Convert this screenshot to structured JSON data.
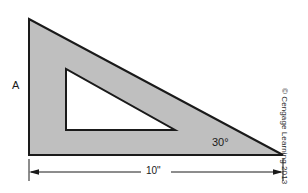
{
  "figure": {
    "labels": {
      "vertical_side": "A",
      "angle": "30°",
      "dimension": "10\""
    },
    "credit": "© Cengage Learning 2013",
    "colors": {
      "background": "#ffffff",
      "fill": "#bfbfbf",
      "outline": "#1a1a1a",
      "dimension_line": "#1a1a1a",
      "inner_fill": "#ffffff"
    },
    "geometry": {
      "outer_triangle": {
        "apex_top": [
          29,
          19
        ],
        "corner_bottom_left": [
          29,
          155
        ],
        "corner_bottom_right": [
          283,
          155
        ]
      },
      "inner_triangle": {
        "corner_top_left": [
          66,
          69
        ],
        "corner_bottom_left": [
          66,
          130
        ],
        "corner_bottom_right": [
          175,
          130
        ]
      },
      "dimension": {
        "y": 172,
        "x_start": 29,
        "x_end": 283,
        "extension_line_top": 158,
        "extension_line_bottom": 180
      }
    }
  }
}
